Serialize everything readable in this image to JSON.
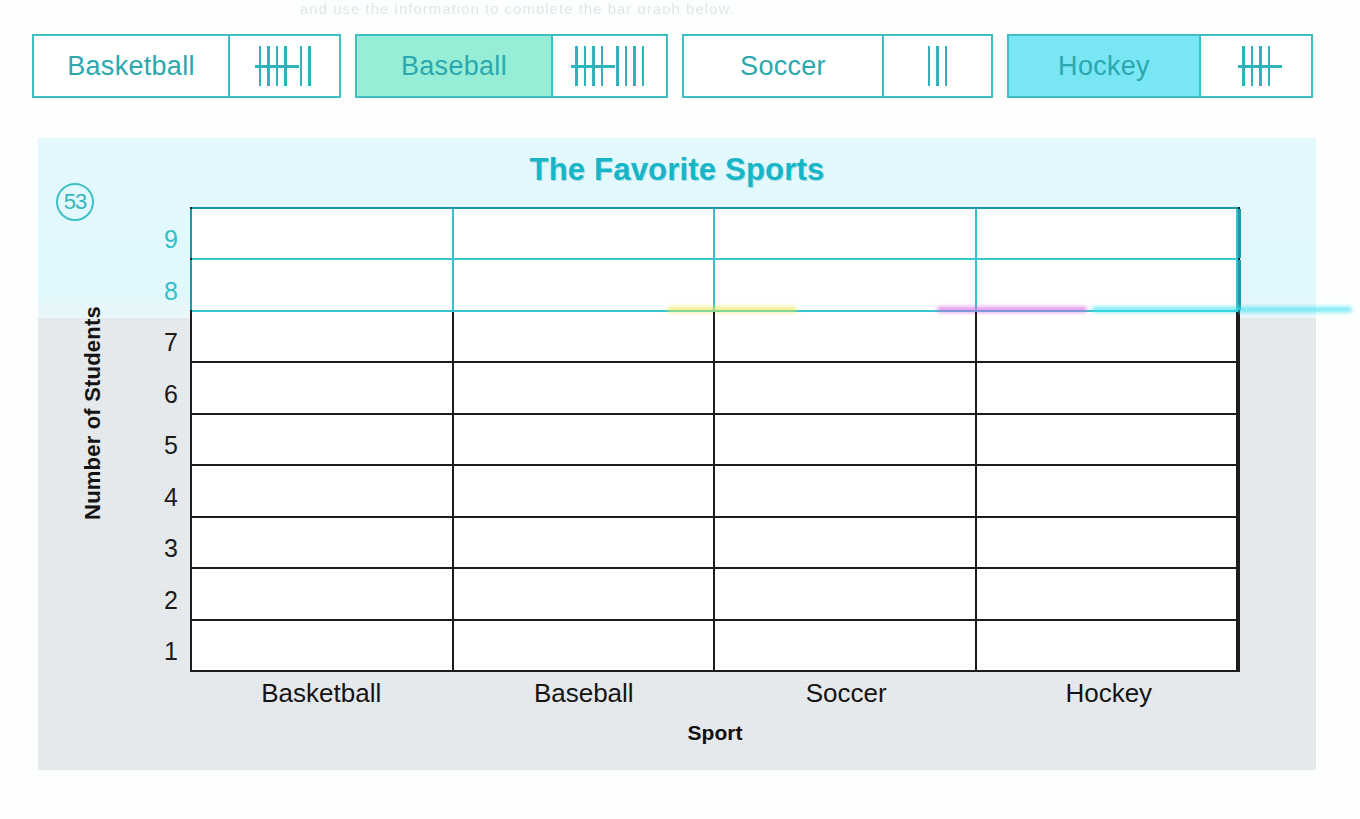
{
  "worksheet": {
    "problem_number": "53",
    "top_cut_text": "and use the information to complete the bar graph below.",
    "tally_table": {
      "rows": [
        {
          "sport": "Basketball",
          "tally_groups_of_five": 1,
          "tally_remainder": 2,
          "count": 7,
          "name_cell_highlight": "none",
          "highlight_color": ""
        },
        {
          "sport": "Baseball",
          "tally_groups_of_five": 1,
          "tally_remainder": 4,
          "count": 9,
          "name_cell_highlight": "mint",
          "highlight_color": "#97eed6"
        },
        {
          "sport": "Soccer",
          "tally_groups_of_five": 0,
          "tally_remainder": 3,
          "count": 3,
          "name_cell_highlight": "none",
          "highlight_color": ""
        },
        {
          "sport": "Hockey",
          "tally_groups_of_five": 1,
          "tally_remainder": 0,
          "count": 5,
          "name_cell_highlight": "cyan",
          "highlight_color": "#79e6f4"
        }
      ]
    }
  },
  "chart_data": {
    "type": "bar",
    "title": "The Favorite Sports",
    "xlabel": "Sport",
    "ylabel": "Number of Students",
    "categories": [
      "Basketball",
      "Baseball",
      "Soccer",
      "Hockey"
    ],
    "values": [
      0,
      0,
      0,
      0
    ],
    "tally_counts": [
      7,
      9,
      3,
      5
    ],
    "ylim": [
      0,
      9
    ],
    "y_ticks": [
      "9",
      "8",
      "7",
      "6",
      "5",
      "4",
      "3",
      "2",
      "1"
    ],
    "grid": true,
    "legend": false,
    "note": "Blank bar-graph grid for the student to fill in; no bars are drawn."
  },
  "colors": {
    "teal_ink": "#2aa8ae",
    "title_teal": "#17b6c6",
    "grid_black": "#1c1c1c",
    "grid_teal": "#36c6cf",
    "card_bg": "#e9edf0",
    "tint_band": "#e3f9fd",
    "mint_highlight": "#97eed6",
    "cyan_highlight": "#79e6f4"
  }
}
